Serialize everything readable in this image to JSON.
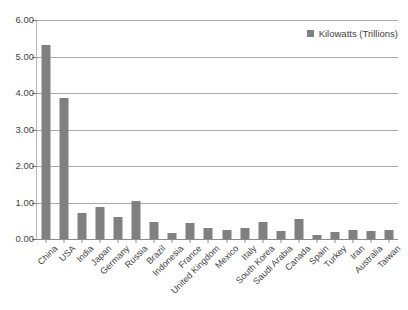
{
  "chart_data": {
    "type": "bar",
    "title": "",
    "xlabel": "",
    "ylabel": "",
    "ylim": [
      0,
      6
    ],
    "ytick_step": 1,
    "ytick_labels": [
      "0.00",
      "1.00",
      "2.00",
      "3.00",
      "4.00",
      "5.00",
      "6.00"
    ],
    "grid": true,
    "legend_position": "top-right",
    "legend": [
      "Kilowatts (Trillions)"
    ],
    "series_name": "Kilowatts (Trillions)",
    "bar_color": "#808080",
    "categories": [
      "China",
      "USA",
      "India",
      "Japan",
      "Germany",
      "Russia",
      "Brazil",
      "Indonesia",
      "France",
      "United Kingdom",
      "Mexico",
      "Italy",
      "South Korea",
      "Saudi Arabia",
      "Canada",
      "Spain",
      "Turkey",
      "Iran",
      "Australia",
      "Taiwan"
    ],
    "values": [
      5.32,
      3.87,
      0.72,
      0.89,
      0.6,
      1.05,
      0.46,
      0.16,
      0.45,
      0.3,
      0.26,
      0.3,
      0.46,
      0.23,
      0.55,
      0.11,
      0.19,
      0.24,
      0.22,
      0.24
    ]
  },
  "legend": {
    "label": "Kilowatts (Trillions)",
    "swatch_color": "#808080"
  }
}
